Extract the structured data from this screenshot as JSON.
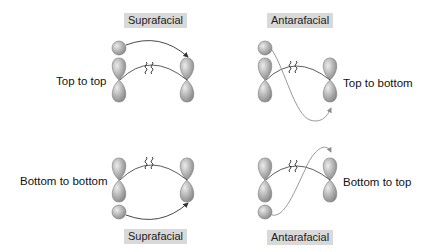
{
  "panels": [
    {
      "id": "top-left",
      "type_label": "Suprafacial",
      "description": "Top to top"
    },
    {
      "id": "top-right",
      "type_label": "Antarafacial",
      "description": "Top to bottom"
    },
    {
      "id": "bottom-left",
      "type_label": "Suprafacial",
      "description": "Bottom to bottom"
    },
    {
      "id": "bottom-right",
      "type_label": "Antarafacial",
      "description": "Bottom to top"
    }
  ],
  "colors": {
    "orbital_fill": "#a6a6a6",
    "orbital_highlight": "#e6e6e6",
    "orbital_stroke": "#7a7a7a",
    "tag_background": "#d9d9d9",
    "supra_arrow": "#333333",
    "antara_arrow": "#8c8c8c",
    "bond_line": "#333333"
  },
  "glyphs": {
    "broken_bond": "≀≀"
  }
}
